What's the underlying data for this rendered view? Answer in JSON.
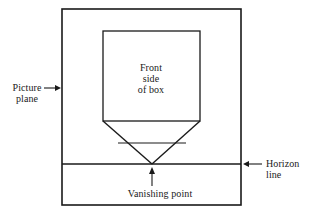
{
  "figure": {
    "kind": "one-point perspective construction diagram",
    "stroke_color": "#1a1a1a",
    "background_color": "#ffffff",
    "labels": {
      "picture_plane_line1": "Picture",
      "picture_plane_line2": "plane",
      "front_side_line1": "Front",
      "front_side_line2": "side",
      "front_side_line3": "of box",
      "horizon_line1": "Horizon",
      "horizon_line2": "line",
      "vanishing_point": "Vanishing point"
    },
    "geometry": {
      "picture_plane_rect": {
        "x": 62,
        "y": 9,
        "width": 179,
        "height": 196
      },
      "front_face_rect": {
        "x": 103,
        "y": 31,
        "width": 97,
        "height": 90
      },
      "horizon_line": {
        "x1": 62,
        "y1": 164,
        "x2": 241,
        "y2": 164
      },
      "vanishing_point": {
        "x": 152,
        "y": 164
      },
      "receding_edge_left": {
        "x1": 103,
        "y1": 121,
        "x2": 152,
        "y2": 164
      },
      "receding_edge_right": {
        "x1": 200,
        "y1": 121,
        "x2": 152,
        "y2": 164
      },
      "back_edge": {
        "x1": 118,
        "y1": 143,
        "x2": 186,
        "y2": 143
      }
    },
    "arrows": {
      "picture_plane_arrow": {
        "x1": 44,
        "y1": 88,
        "x2": 61,
        "y2": 88,
        "direction": "right"
      },
      "horizon_arrow": {
        "x1": 262,
        "y1": 164,
        "x2": 243,
        "y2": 164,
        "direction": "left"
      },
      "vanishing_point_arrow": {
        "x1": 152,
        "y1": 186,
        "x2": 152,
        "y2": 168,
        "direction": "up"
      }
    }
  }
}
